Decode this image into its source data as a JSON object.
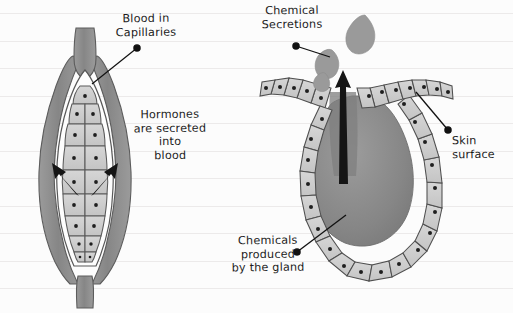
{
  "page": {
    "background_color": "#fcfcfc",
    "rule_line_color": "#eceaea",
    "rule_line_spacing": 27.5,
    "rule_line_first_y": 13
  },
  "palette": {
    "ink": "#1b1b1b",
    "cell_fill": "#cdcdcd",
    "cell_outline": "#545454",
    "nucleus": "#1f1f1f",
    "lumen_fill": "#8a8a8a",
    "capsule_fill": "#8f8f8f",
    "capsule_outline": "#5a5a5a",
    "interior_white": "#fdfdfd",
    "droplet_fill": "#9a9a9a",
    "arrow_fill": "#151515"
  },
  "labels": [
    {
      "id": "blood-in-capillaries",
      "text": "Blood in\nCapillaries",
      "leader": {
        "from_x": 137,
        "from_y": 48,
        "to_x": 93,
        "to_y": 82,
        "dot_x": 137,
        "dot_y": 48
      }
    },
    {
      "id": "hormones-secreted",
      "text": "Hormones\nare secreted\ninto\nblood"
    },
    {
      "id": "chemical-secretions",
      "text": "Chemical\nSecretions",
      "leader": {
        "from_x": 296,
        "from_y": 46,
        "to_x": 329,
        "to_y": 56,
        "dot_x": 296,
        "dot_y": 46
      }
    },
    {
      "id": "skin-surface",
      "text": "Skin\nsurface",
      "leader": {
        "from_x": 448,
        "from_y": 130,
        "to_x": 415,
        "to_y": 92,
        "dot_x": 448,
        "dot_y": 130
      }
    },
    {
      "id": "chemicals-produced-by-gland",
      "text": "Chemicals\nproduced\nby the gland",
      "leader": {
        "from_x": 297,
        "top_y": 252,
        "to_x": 345,
        "to_y": 216,
        "dot_x": 297,
        "dot_y": 252
      }
    }
  ],
  "diagrams": {
    "endocrine_gland": {
      "name": "endocrine-gland-left",
      "description": "Ductless gland: capsule with blood capillaries, inner secretory cell mass, hormones released into blood",
      "cell_rows": 8,
      "secretion_arrows": 2
    },
    "exocrine_gland": {
      "name": "exocrine-gland-right",
      "description": "Gland with duct opening at skin surface: ring of secretory cells, lumen, duct arrow, chemical droplets",
      "cell_count": 26,
      "droplets": 3,
      "duct_arrows": 1
    }
  }
}
